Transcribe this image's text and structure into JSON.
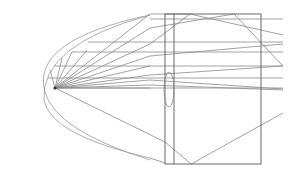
{
  "diagram": {
    "type": "optics-ray-diagram",
    "background": "#ffffff",
    "line_color": "#8a8a8a",
    "dark_line_color": "#5a5a5a",
    "focal_point": {
      "x": 55,
      "y": 88
    },
    "reflector_path": "M 150 15 Q 30 40 45 92 Q 55 130 150 160",
    "outer_curve_path": "M 150 15 Q 40 45 44 100 Q 50 135 150 158",
    "box": {
      "x": 165,
      "y": 14,
      "width": 96,
      "height": 150
    },
    "inner_vertical_x": 174,
    "lens": {
      "cx": 169,
      "top": 72,
      "bottom": 107,
      "rx": 5
    },
    "rays_from_focus": [
      {
        "x2": 150,
        "y2": 14
      },
      {
        "x2": 150,
        "y2": 28
      },
      {
        "x2": 150,
        "y2": 44
      },
      {
        "x2": 150,
        "y2": 56
      },
      {
        "x2": 150,
        "y2": 66
      },
      {
        "x2": 150,
        "y2": 75
      },
      {
        "x2": 150,
        "y2": 80
      },
      {
        "x2": 150,
        "y2": 85
      },
      {
        "x2": 150,
        "y2": 88
      },
      {
        "x2": 87,
        "y2": 50
      },
      {
        "x2": 72,
        "y2": 52
      },
      {
        "x2": 62,
        "y2": 58
      },
      {
        "x2": 50,
        "y2": 70
      }
    ],
    "horizontal_lines": [
      {
        "x1": 88,
        "y1": 42,
        "x2": 283,
        "y2": 42
      },
      {
        "x1": 72,
        "y1": 52,
        "x2": 283,
        "y2": 52
      },
      {
        "x1": 55,
        "y1": 66,
        "x2": 283,
        "y2": 66
      },
      {
        "x1": 150,
        "y1": 19,
        "x2": 283,
        "y2": 19
      },
      {
        "x1": 48,
        "y1": 78,
        "x2": 283,
        "y2": 78
      },
      {
        "x1": 55,
        "y1": 88,
        "x2": 283,
        "y2": 88
      }
    ],
    "crossing_rays": [
      {
        "x1": 150,
        "y1": 14,
        "x2": 190,
        "y2": 14
      },
      {
        "x1": 190,
        "y1": 14,
        "x2": 283,
        "y2": 35
      },
      {
        "x1": 150,
        "y1": 28,
        "x2": 234,
        "y2": 14
      },
      {
        "x1": 234,
        "y1": 14,
        "x2": 283,
        "y2": 66
      },
      {
        "x1": 150,
        "y1": 44,
        "x2": 190,
        "y2": 14
      },
      {
        "x1": 150,
        "y1": 56,
        "x2": 283,
        "y2": 44
      },
      {
        "x1": 150,
        "y1": 75,
        "x2": 283,
        "y2": 66
      },
      {
        "x1": 150,
        "y1": 85,
        "x2": 283,
        "y2": 90
      },
      {
        "x1": 150,
        "y1": 80,
        "x2": 283,
        "y2": 89
      },
      {
        "x1": 55,
        "y1": 88,
        "x2": 165,
        "y2": 142
      },
      {
        "x1": 165,
        "y1": 142,
        "x2": 191,
        "y2": 164
      },
      {
        "x1": 191,
        "y1": 164,
        "x2": 283,
        "y2": 113
      },
      {
        "x1": 150,
        "y1": 158,
        "x2": 165,
        "y2": 163
      }
    ]
  }
}
